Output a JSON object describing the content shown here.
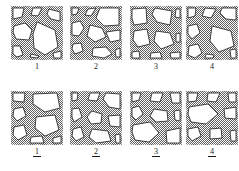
{
  "figure": {
    "name": "micrograph-panel-grid",
    "background_color": "#ffffff",
    "texture_fill_color": "#7d7d7d",
    "void_fill_color": "#ffffff",
    "outline_color": "#1a1a1a",
    "rows": [
      {
        "row_id": "top",
        "label_style": "plain",
        "panels": [
          {
            "label": "1"
          },
          {
            "label": "2"
          },
          {
            "label": "3"
          },
          {
            "label": "4"
          }
        ]
      },
      {
        "row_id": "bottom",
        "label_style": "underlined",
        "panels": [
          {
            "label": "1"
          },
          {
            "label": "2"
          },
          {
            "label": "3"
          },
          {
            "label": "4"
          }
        ]
      }
    ]
  }
}
